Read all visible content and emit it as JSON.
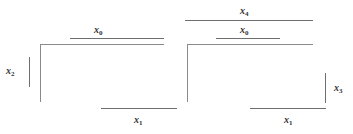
{
  "figure": {
    "type": "karnaugh-map-pair",
    "cell_true_value": "1",
    "cell_false_value": "",
    "line_color": "#6e6e6e",
    "grid_color": "#8a8a8a",
    "text_color": "#333333",
    "background": "#ffffff"
  },
  "maps": [
    {
      "id": "left-map",
      "name": "left-kmap",
      "caption": "x4 equals 0 half",
      "rows": 4,
      "cols": 4,
      "cells": [
        [
          "",
          "1",
          "",
          ""
        ],
        [
          "1",
          "1",
          "",
          ""
        ],
        [
          "1",
          "1",
          "",
          ""
        ],
        [
          "1",
          "1",
          "1",
          "1"
        ]
      ],
      "labels": {
        "top": {
          "text": "x",
          "sub": "0",
          "name": "x0"
        },
        "bottom": {
          "text": "x",
          "sub": "1",
          "name": "x1"
        },
        "left": {
          "text": "x",
          "sub": "2",
          "name": "x2"
        }
      }
    },
    {
      "id": "right-map",
      "name": "right-kmap",
      "caption": "x4 equals 1 half",
      "rows": 4,
      "cols": 4,
      "cells": [
        [
          "",
          "1",
          "1",
          ""
        ],
        [
          "",
          "",
          "",
          ""
        ],
        [
          "",
          "",
          "",
          ""
        ],
        [
          "",
          "1",
          "",
          ""
        ]
      ],
      "labels": {
        "top": {
          "text": "x",
          "sub": "0",
          "name": "x0"
        },
        "bottom": {
          "text": "x",
          "sub": "1",
          "name": "x1"
        },
        "right": {
          "text": "x",
          "sub": "3",
          "name": "x3"
        },
        "outer_top": {
          "text": "x",
          "sub": "4",
          "name": "x4"
        }
      }
    }
  ],
  "labels": {
    "left_x0": "x",
    "left_x0_sub": "0",
    "left_x1": "x",
    "left_x1_sub": "1",
    "left_x2": "x",
    "left_x2_sub": "2",
    "right_x4": "x",
    "right_x4_sub": "4",
    "right_x0": "x",
    "right_x0_sub": "0",
    "right_x1": "x",
    "right_x1_sub": "1",
    "right_x3": "x",
    "right_x3_sub": "3"
  }
}
